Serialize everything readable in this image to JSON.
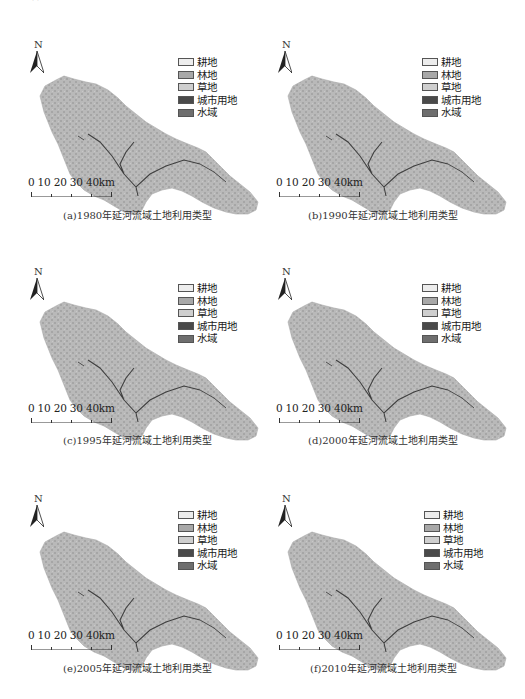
{
  "figure": {
    "top_fragment": "（ ）",
    "legend": {
      "items": [
        {
          "label": "耕地",
          "color": "#ededed"
        },
        {
          "label": "林地",
          "color": "#a8a8a8"
        },
        {
          "label": "草地",
          "color": "#cfcfcf"
        },
        {
          "label": "城市用地",
          "color": "#4a4a4a"
        },
        {
          "label": "水域",
          "color": "#6e6e6e"
        }
      ]
    },
    "north_label": "N",
    "scale_label": "0  10 20 30 40km",
    "panels": [
      {
        "id": "a",
        "caption": "(a)1980年延河流域土地利用类型",
        "year": "1980"
      },
      {
        "id": "b",
        "caption": "(b)1990年延河流域土地利用类型",
        "year": "1990"
      },
      {
        "id": "c",
        "caption": "(c)1995年延河流域土地利用类型",
        "year": "1995"
      },
      {
        "id": "d",
        "caption": "(d)2000年延河流域土地利用类型",
        "year": "2000"
      },
      {
        "id": "e",
        "caption": "(e)2005年延河流域土地利用类型",
        "year": "2005"
      },
      {
        "id": "f",
        "caption": "(f)2010年延河流域土地利用类型",
        "year": "2010"
      }
    ],
    "colors": {
      "map_fill": "#b9b9b9",
      "map_texture": "#a6a6a6",
      "river": "#3f3f3f"
    }
  }
}
